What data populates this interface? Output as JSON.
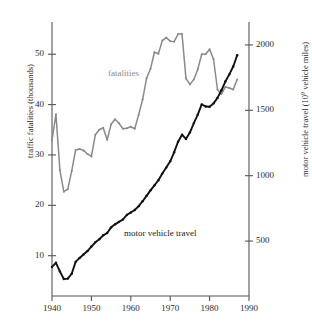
{
  "chart_data": {
    "type": "line",
    "title": "",
    "xlabel": "",
    "xlim": [
      1940,
      1990
    ],
    "xticks": [
      1940,
      1950,
      1960,
      1970,
      1980,
      1990
    ],
    "grid": false,
    "legend": "inline-annotations",
    "axes": {
      "left": {
        "label": "traffic fatalities (thousands)",
        "ticks": [
          10,
          20,
          30,
          40,
          50
        ],
        "lim": [
          2,
          56
        ]
      },
      "right": {
        "label_prefix": "motor vehicle travel (10",
        "label_sup": "9",
        "label_suffix": " vehicle miles)",
        "label": "motor vehicle travel (10⁹ vehicle miles)",
        "ticks": [
          500,
          1000,
          1500,
          2000
        ],
        "lim": [
          80,
          2160
        ]
      }
    },
    "series": [
      {
        "name": "fatalities",
        "axis": "left",
        "color": "#8a8a8a",
        "annotation": "fatalities",
        "x": [
          1940,
          1941,
          1942,
          1943,
          1944,
          1945,
          1946,
          1947,
          1948,
          1949,
          1950,
          1951,
          1952,
          1953,
          1954,
          1955,
          1956,
          1957,
          1958,
          1959,
          1960,
          1961,
          1962,
          1963,
          1964,
          1965,
          1966,
          1967,
          1968,
          1969,
          1970,
          1971,
          1972,
          1973,
          1974,
          1975,
          1976,
          1977,
          1978,
          1979,
          1980,
          1981,
          1982,
          1983,
          1984,
          1985,
          1986,
          1987
        ],
        "values": [
          32.9,
          38.1,
          27.0,
          22.7,
          23.2,
          26.8,
          31.0,
          31.2,
          30.9,
          30.2,
          29.7,
          34.0,
          35.0,
          35.4,
          33.0,
          36.1,
          37.1,
          36.3,
          35.2,
          35.3,
          35.6,
          35.2,
          38.0,
          41.0,
          45.2,
          47.1,
          50.4,
          50.1,
          52.7,
          53.3,
          52.6,
          52.5,
          54.0,
          54.0,
          45.2,
          44.0,
          45.0,
          47.0,
          50.0,
          50.0,
          51.0,
          49.0,
          43.0,
          42.1,
          43.5,
          43.3,
          43.0,
          45.0
        ]
      },
      {
        "name": "motor vehicle travel",
        "axis": "right",
        "color": "#111111",
        "annotation": "motor vehicle travel",
        "x": [
          1940,
          1941,
          1942,
          1943,
          1944,
          1945,
          1946,
          1947,
          1948,
          1949,
          1950,
          1951,
          1952,
          1953,
          1954,
          1955,
          1956,
          1957,
          1958,
          1959,
          1960,
          1961,
          1962,
          1963,
          1964,
          1965,
          1966,
          1967,
          1968,
          1969,
          1970,
          1971,
          1972,
          1973,
          1974,
          1975,
          1976,
          1977,
          1978,
          1979,
          1980,
          1981,
          1982,
          1983,
          1984,
          1985,
          1986,
          1987
        ],
        "values": [
          302,
          334,
          268,
          210,
          213,
          250,
          341,
          371,
          398,
          424,
          458,
          491,
          514,
          544,
          562,
          605,
          628,
          647,
          665,
          700,
          719,
          738,
          767,
          805,
          846,
          888,
          926,
          965,
          1016,
          1062,
          1110,
          1179,
          1260,
          1313,
          1281,
          1330,
          1402,
          1467,
          1545,
          1529,
          1527,
          1553,
          1595,
          1653,
          1720,
          1775,
          1835,
          1921
        ]
      }
    ]
  },
  "labels": {
    "left_axis": "traffic fatalities (thousands)",
    "right_axis_prefix": "motor vehicle travel (10",
    "right_axis_sup": "9",
    "right_axis_suffix": " vehicle miles)",
    "fatalities_annotation": "fatalities",
    "travel_annotation": "motor vehicle travel"
  },
  "colors": {
    "fatalities": "#8a8a8a",
    "travel": "#111111",
    "axis": "#555555",
    "text": "#2b2b2b"
  }
}
